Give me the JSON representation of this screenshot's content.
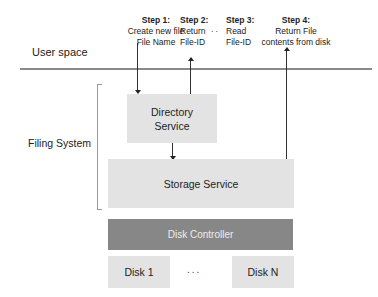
{
  "steps": [
    {
      "heading": "Step 1:",
      "line1": "Create new file",
      "line2": "File Name"
    },
    {
      "heading": "Step 2:",
      "line1": "Return",
      "line2": "File-ID"
    },
    {
      "heading": "Step 3:",
      "line1": "Read",
      "line2": "File-ID"
    },
    {
      "heading": "Step 4:",
      "line1": "Return File",
      "line2": "contents from disk"
    }
  ],
  "between_steps_ellipsis": "..",
  "labels": {
    "user_space": "User space",
    "filing_system": "Filing System"
  },
  "boxes": {
    "directory_service_line1": "Directory",
    "directory_service_line2": "Service",
    "storage_service": "Storage Service",
    "disk_controller": "Disk Controller",
    "disk_first": "Disk 1",
    "disk_last": "Disk N",
    "disk_ellipsis": "..."
  },
  "colors": {
    "service_box": "#e3e3e3",
    "controller_box": "#878787",
    "divider_line": "#8a8a8a"
  }
}
